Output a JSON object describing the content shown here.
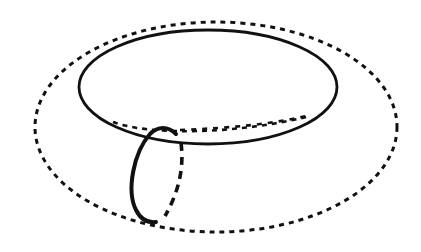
{
  "figure": {
    "background": "#ffffff",
    "stroke_color": "#111111",
    "elements": {
      "outer_equator": {
        "style": "dashed",
        "cx": 216,
        "cy": 127,
        "rx": 181,
        "ry": 105
      },
      "inner_hole_front": {
        "style": "solid",
        "cx": 208,
        "cy": 87,
        "rx": 129,
        "ry": 57
      },
      "inner_hole_back": {
        "style": "dotted"
      },
      "meridian_front": {
        "style": "solid-thick"
      },
      "meridian_back": {
        "style": "dashed-thick"
      }
    }
  }
}
